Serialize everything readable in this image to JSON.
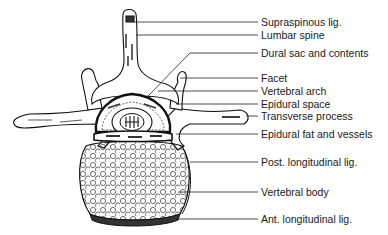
{
  "diagram": {
    "labels": [
      {
        "id": "supraspinous-lig",
        "text": "Supraspinous lig.",
        "y": 22
      },
      {
        "id": "lumbar-spine",
        "text": "Lumbar spine",
        "y": 35
      },
      {
        "id": "dural-sac",
        "text": "Dural sac and contents",
        "y": 53
      },
      {
        "id": "facet",
        "text": "Facet",
        "y": 78
      },
      {
        "id": "vertebral-arch",
        "text": "Vertebral arch",
        "y": 91
      },
      {
        "id": "epidural-space",
        "text": "Epidural space",
        "y": 104
      },
      {
        "id": "transverse-process",
        "text": "Transverse process",
        "y": 116
      },
      {
        "id": "epidural-fat",
        "text": "Epidural fat and vessels",
        "y": 134
      },
      {
        "id": "post-longitudinal-lig",
        "text": "Post. longitudinal lig.",
        "y": 162
      },
      {
        "id": "vertebral-body",
        "text": "Vertebral body",
        "y": 192
      },
      {
        "id": "ant-longitudinal-lig",
        "text": "Ant. longitudinal lig.",
        "y": 219
      }
    ],
    "colors": {
      "line": "#1a1a1a",
      "background": "#ffffff"
    }
  }
}
